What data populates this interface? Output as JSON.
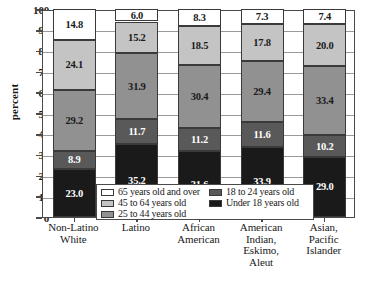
{
  "chart_data": {
    "type": "bar",
    "subtype": "stacked-bar-100",
    "title": "",
    "xlabel": "",
    "ylabel": "percent",
    "ylim": [
      0,
      100
    ],
    "ytick_values": [
      0,
      10,
      20,
      30,
      40,
      50,
      60,
      70,
      80,
      90,
      100
    ],
    "ytick_labels": [
      "0",
      "10",
      "20",
      "30",
      "40",
      "50",
      "60",
      "70",
      "80",
      "90",
      "100"
    ],
    "grid": true,
    "legend_position": "inside-bottom-center",
    "categories": [
      "Non-Latino\nWhite",
      "Latino",
      "African\nAmerican",
      "American\nIndian,\nEskimo,\nAleut",
      "Asian,\nPacific\nIslander"
    ],
    "category_lines": [
      [
        "Non-Latino",
        "White"
      ],
      [
        "Latino"
      ],
      [
        "African",
        "American"
      ],
      [
        "American",
        "Indian,",
        "Eskimo,",
        "Aleut"
      ],
      [
        "Asian,",
        "Pacific",
        "Islander"
      ]
    ],
    "series": [
      {
        "name": "Under 18 years old",
        "color": "#1a1a1a",
        "text_color": "#ffffff",
        "values": [
          23.0,
          35.2,
          31.6,
          33.9,
          29.0
        ],
        "labels": [
          "23.0",
          "35.2",
          "31.6",
          "33.9",
          "29.0"
        ]
      },
      {
        "name": "18 to 24 years old",
        "color": "#595959",
        "text_color": "#ffffff",
        "values": [
          8.9,
          11.7,
          11.2,
          11.6,
          10.2
        ],
        "labels": [
          "8.9",
          "11.7",
          "11.2",
          "11.6",
          "10.2"
        ]
      },
      {
        "name": "25 to 44 years old",
        "color": "#919191",
        "text_color": "#1a1a1a",
        "values": [
          29.2,
          31.9,
          30.4,
          29.4,
          33.4
        ],
        "labels": [
          "29.2",
          "31.9",
          "30.4",
          "29.4",
          "33.4"
        ]
      },
      {
        "name": "45 to 64 years old",
        "color": "#c4c4c4",
        "text_color": "#1a1a1a",
        "values": [
          24.1,
          15.2,
          18.5,
          17.8,
          20.0
        ],
        "labels": [
          "24.1",
          "15.2",
          "18.5",
          "17.8",
          "20.0"
        ]
      },
      {
        "name": "65 years old and over",
        "color": "#ffffff",
        "text_color": "#1a1a1a",
        "values": [
          14.8,
          6.0,
          8.3,
          7.3,
          7.4
        ],
        "labels": [
          "14.8",
          "6.0",
          "8.3",
          "7.3",
          "7.4"
        ]
      }
    ]
  },
  "legend": {
    "left_column": [
      {
        "label": "65 years old and over",
        "color": "#ffffff"
      },
      {
        "label": "45 to 64 years old",
        "color": "#c4c4c4"
      },
      {
        "label": "25 to 44 years old",
        "color": "#919191"
      }
    ],
    "right_column": [
      {
        "label": "18 to 24 years old",
        "color": "#595959"
      },
      {
        "label": "Under 18 years old",
        "color": "#1a1a1a"
      }
    ]
  }
}
